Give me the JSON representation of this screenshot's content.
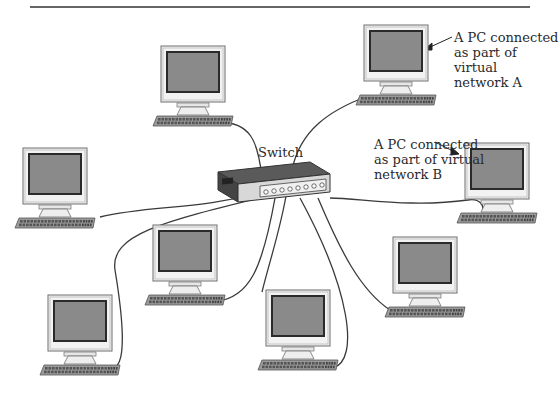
{
  "diagram": {
    "title_rule": true,
    "switch": {
      "label": "Switch",
      "x": 218,
      "y": 162,
      "w": 112,
      "h": 40
    },
    "annotations": [
      {
        "id": "network-a",
        "text": "A PC connected\nas part of virtual\nnetwork A",
        "x": 454,
        "y": 30
      },
      {
        "id": "network-b",
        "text": "A PC connected\nas part of virtual\nnetwork B",
        "x": 374,
        "y": 137
      }
    ],
    "pcs": [
      {
        "id": "pc-top-left",
        "x": 153,
        "y": 46,
        "network": ""
      },
      {
        "id": "pc-top-right",
        "x": 356,
        "y": 25,
        "network": "A"
      },
      {
        "id": "pc-mid-left",
        "x": 15,
        "y": 148,
        "network": ""
      },
      {
        "id": "pc-mid-right",
        "x": 457,
        "y": 143,
        "network": "B"
      },
      {
        "id": "pc-center-left",
        "x": 145,
        "y": 225,
        "network": ""
      },
      {
        "id": "pc-bottom-left",
        "x": 40,
        "y": 295,
        "network": ""
      },
      {
        "id": "pc-bottom-center",
        "x": 258,
        "y": 290,
        "network": ""
      },
      {
        "id": "pc-bottom-right",
        "x": 385,
        "y": 237,
        "network": ""
      }
    ],
    "colors": {
      "screen": "#8a8a8a",
      "bezel": "#f2f2f2",
      "outline": "#6e6e6e",
      "keyboard": "#9a9a9a",
      "cable": "#3a3a3a",
      "switch_top": "#5a5a5a",
      "switch_front": "#d8d8d8"
    }
  }
}
